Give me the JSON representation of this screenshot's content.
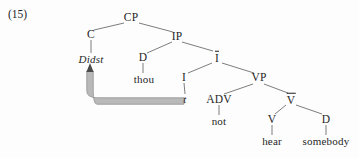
{
  "figure": {
    "example_number": "(15)",
    "background_color": "#fdfdfd",
    "text_color": "#1f1f1f",
    "movement_arrow_color": "#b9b9b9",
    "movement_arrow_edge_color": "#8a8a8a",
    "branch_color": "#6e6e6e"
  },
  "tree": {
    "nodes": {
      "cp": {
        "label": "CP",
        "x": 131,
        "y": 18,
        "bar": false,
        "italic": false
      },
      "c": {
        "label": "C",
        "x": 91,
        "y": 35,
        "bar": false,
        "italic": false
      },
      "didst": {
        "label": "Didst",
        "x": 91,
        "y": 59,
        "bar": false,
        "italic": true
      },
      "ip": {
        "label": "IP",
        "x": 177,
        "y": 37,
        "bar": false,
        "italic": false
      },
      "d_subj": {
        "label": "D",
        "x": 143,
        "y": 58,
        "bar": false,
        "italic": false
      },
      "thou": {
        "label": "thou",
        "x": 144,
        "y": 79,
        "bar": false,
        "italic": false
      },
      "ibar": {
        "label": "I",
        "x": 217,
        "y": 57,
        "bar": true,
        "italic": false
      },
      "i": {
        "label": "I",
        "x": 184,
        "y": 78,
        "bar": false,
        "italic": false
      },
      "trace": {
        "label": "t",
        "x": 185,
        "y": 99,
        "bar": false,
        "italic": true
      },
      "vp": {
        "label": "VP",
        "x": 259,
        "y": 78,
        "bar": false,
        "italic": false
      },
      "adv": {
        "label": "ADV",
        "x": 219,
        "y": 100,
        "bar": false,
        "italic": false
      },
      "not": {
        "label": "not",
        "x": 219,
        "y": 121,
        "bar": false,
        "italic": false
      },
      "vbar": {
        "label": "V",
        "x": 291,
        "y": 99,
        "bar": true,
        "italic": false
      },
      "v": {
        "label": "V",
        "x": 272,
        "y": 120,
        "bar": false,
        "italic": false
      },
      "hear": {
        "label": "hear",
        "x": 272,
        "y": 141,
        "bar": false,
        "italic": false
      },
      "d_obj": {
        "label": "D",
        "x": 326,
        "y": 120,
        "bar": false,
        "italic": false
      },
      "somebody": {
        "label": "somebody",
        "x": 326,
        "y": 141,
        "bar": false,
        "italic": false
      }
    },
    "branches": [
      {
        "from": "cp",
        "to": "c",
        "x1": 124,
        "y1": 23,
        "x2": 94,
        "y2": 30
      },
      {
        "from": "cp",
        "to": "ip",
        "x1": 139,
        "y1": 23,
        "x2": 173,
        "y2": 32
      },
      {
        "from": "c",
        "to": "didst",
        "x1": 91,
        "y1": 40,
        "x2": 91,
        "y2": 53
      },
      {
        "from": "ip",
        "to": "d_subj",
        "x1": 172,
        "y1": 42,
        "x2": 147,
        "y2": 53
      },
      {
        "from": "ip",
        "to": "ibar",
        "x1": 182,
        "y1": 42,
        "x2": 213,
        "y2": 51
      },
      {
        "from": "d_subj",
        "to": "thou",
        "x1": 143,
        "y1": 63,
        "x2": 143,
        "y2": 73
      },
      {
        "from": "ibar",
        "to": "i",
        "x1": 212,
        "y1": 63,
        "x2": 188,
        "y2": 73
      },
      {
        "from": "ibar",
        "to": "vp",
        "x1": 222,
        "y1": 63,
        "x2": 254,
        "y2": 73
      },
      {
        "from": "i",
        "to": "trace",
        "x1": 184,
        "y1": 83,
        "x2": 185,
        "y2": 94
      },
      {
        "from": "vp",
        "to": "adv",
        "x1": 253,
        "y1": 84,
        "x2": 224,
        "y2": 94
      },
      {
        "from": "vp",
        "to": "vbar",
        "x1": 264,
        "y1": 84,
        "x2": 288,
        "y2": 93
      },
      {
        "from": "adv",
        "to": "not",
        "x1": 219,
        "y1": 105,
        "x2": 219,
        "y2": 115
      },
      {
        "from": "vbar",
        "to": "v",
        "x1": 286,
        "y1": 105,
        "x2": 275,
        "y2": 114
      },
      {
        "from": "vbar",
        "to": "d_obj",
        "x1": 296,
        "y1": 105,
        "x2": 322,
        "y2": 114
      },
      {
        "from": "v",
        "to": "hear",
        "x1": 272,
        "y1": 125,
        "x2": 272,
        "y2": 135
      },
      {
        "from": "d_obj",
        "to": "somebody",
        "x1": 326,
        "y1": 125,
        "x2": 326,
        "y2": 135
      }
    ],
    "movement_arrow": {
      "from": "trace",
      "to": "didst",
      "description": "head movement from I trace up to C position Didst",
      "start_x": 184,
      "start_y": 101,
      "corner_x": 90,
      "corner_y": 101,
      "end_x": 90,
      "end_y": 65
    }
  }
}
